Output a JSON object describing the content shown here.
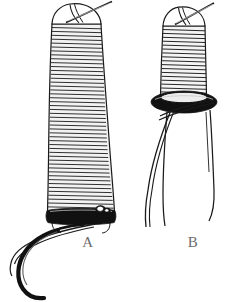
{
  "figure": {
    "background_color": "#ffffff",
    "ink_color": "#111111",
    "caption_color": "#6d6d6d",
    "panels": [
      {
        "label": "A",
        "name": "panel-a",
        "subject": "hook-with-long-thread-wrap",
        "description": "Long cylindrical thread wrapping on a hook shank, finished with a thick black whip band at the bottom, with the curved hook bend and point emerging below-left and two thread tag ends trailing.",
        "elements": [
          "dome-cap",
          "crossed-thread-at-top",
          "thread-wrap-body",
          "black-whip-band",
          "knot-detail",
          "hook-bend",
          "trailing-thread"
        ],
        "wrap_count": 54
      },
      {
        "label": "B",
        "name": "panel-b",
        "subject": "shorter-wrap-with-torus-band",
        "description": "Shorter tapered thread wrapping ending in a thick black torus-shaped whip band, with four loose thread strands hanging below.",
        "elements": [
          "dome-cap",
          "crossed-thread-at-top",
          "thread-wrap-body",
          "black-torus-band",
          "loose-thread-strands"
        ],
        "wrap_count": 23,
        "strand_count": 4
      }
    ]
  }
}
